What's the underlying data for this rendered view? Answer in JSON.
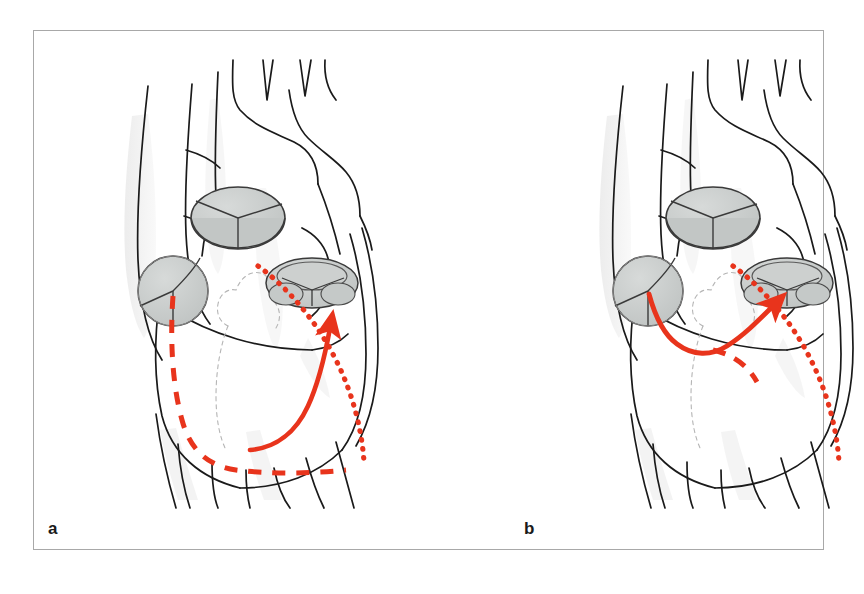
{
  "figure": {
    "type": "medical-illustration",
    "panel_count": 2,
    "background_color": "#ffffff",
    "frame_color": "#a8a8a8",
    "outline_color": "#1a1a1a",
    "valve_fill_color": "#c9cccb",
    "valve_stroke_color": "#3a3a3a",
    "shading_color": "#ededed",
    "accent_red": "#e8341c",
    "ghost_outline_color": "#b5b5b5"
  },
  "panels": [
    {
      "id": "a",
      "label": "a",
      "pathways": [
        {
          "name": "dashed-pathway",
          "style": "dashed",
          "color": "#e8341c",
          "description": "Dashed red path descending from the mitral valve toward the apex then running rightward along the inferior wall"
        },
        {
          "name": "solid-arrow-pathway",
          "style": "solid-arrow",
          "color": "#e8341c",
          "description": "Solid red arrow curving from the inferior wall upward and to the right, arrowhead pointing up-right"
        },
        {
          "name": "dotted-pathway",
          "style": "dotted",
          "color": "#e8341c",
          "description": "Dotted red arc sweeping from below the aortic valve down the right free wall to the inferior margin"
        }
      ]
    },
    {
      "id": "b",
      "label": "b",
      "pathways": [
        {
          "name": "solid-arrow-pathway",
          "style": "solid-arrow",
          "color": "#e8341c",
          "description": "Short solid red arrow leaving the mitral valve, dipping down then rising to the right with arrowhead up-right"
        },
        {
          "name": "dashed-branch-pathway",
          "style": "dashed",
          "color": "#e8341c",
          "description": "Short dashed red branch descending to the right from the solid arrow"
        },
        {
          "name": "dotted-pathway",
          "style": "dotted",
          "color": "#e8341c",
          "description": "Dotted red arc sweeping from below the aortic valve down the right free wall to the inferior margin"
        }
      ]
    }
  ],
  "valves": [
    {
      "name": "pulmonary-valve",
      "cusps": 3,
      "shape": "ellipse-3d",
      "position": "upper-middle"
    },
    {
      "name": "aortic-valve",
      "cusps": 3,
      "shape": "ellipse-flat",
      "position": "middle-right"
    },
    {
      "name": "mitral-valve",
      "cusps": 3,
      "shape": "circle",
      "position": "left"
    }
  ],
  "vessels": [
    {
      "name": "aortic-arch",
      "branches": 3
    },
    {
      "name": "superior-vena-cava"
    },
    {
      "name": "pulmonary-artery"
    },
    {
      "name": "pulmonary-veins"
    },
    {
      "name": "inferior-vessels"
    }
  ],
  "caption": {
    "visible_fragment": ""
  }
}
